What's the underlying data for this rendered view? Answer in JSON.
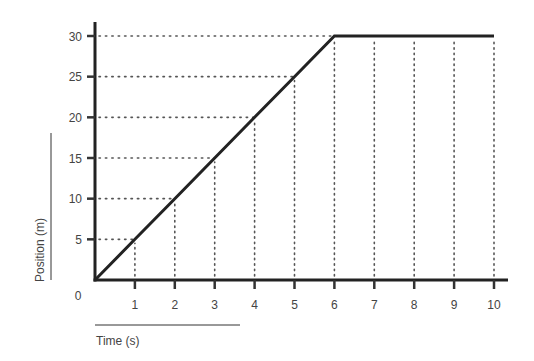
{
  "chart_data": {
    "type": "line",
    "title": "",
    "xlabel": "Time (s)",
    "ylabel": "Position (m)",
    "x": [
      0,
      1,
      2,
      3,
      4,
      5,
      6,
      7,
      8,
      9,
      10
    ],
    "series": [
      {
        "name": "Position",
        "values": [
          0,
          5,
          10,
          15,
          20,
          25,
          30,
          30,
          30,
          30,
          30
        ]
      }
    ],
    "xticks": [
      "1",
      "2",
      "3",
      "4",
      "5",
      "6",
      "7",
      "8",
      "9",
      "10"
    ],
    "yticks": [
      "0",
      "5",
      "10",
      "15",
      "20",
      "25",
      "30"
    ],
    "xlim": [
      0,
      10
    ],
    "ylim": [
      0,
      30
    ],
    "grid": "dotted guide lines at each tick",
    "legend": "none"
  },
  "colors": {
    "line": "#222222",
    "grid": "#555555",
    "text": "#444444"
  }
}
